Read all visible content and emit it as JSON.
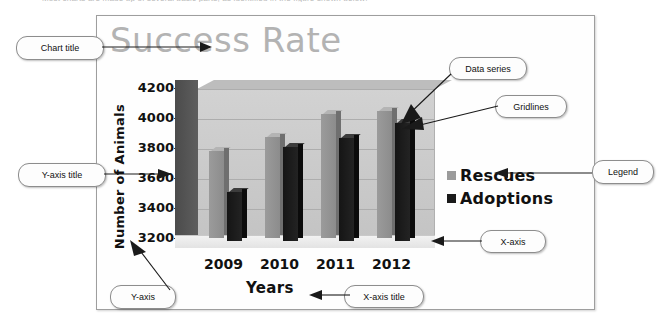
{
  "top_caption": "Most charts are made up of several basic parts, as identified in the figure shown below:",
  "slide": {
    "chart_title": "Success Rate"
  },
  "chart_data": {
    "type": "bar",
    "title": "Success Rate",
    "xlabel": "Years",
    "ylabel": "Number of Animals",
    "categories": [
      "2009",
      "2010",
      "2011",
      "2012"
    ],
    "ytick_labels": [
      "3200",
      "3400",
      "3600",
      "3800",
      "4000",
      "4200"
    ],
    "ylim": [
      3200,
      4200
    ],
    "ytick_step": 200,
    "grid": true,
    "legend_position": "right",
    "three_d": true,
    "series": [
      {
        "name": "Rescues",
        "color": "#9b9b9b",
        "values": [
          3780,
          3875,
          4025,
          4045
        ]
      },
      {
        "name": "Adoptions",
        "color": "#1a1a1a",
        "values": [
          3530,
          3825,
          3890,
          3985
        ]
      }
    ]
  },
  "callouts": {
    "chart_title": {
      "label": "Chart title"
    },
    "data_series": {
      "label": "Data series"
    },
    "gridlines": {
      "label": "Gridlines"
    },
    "y_axis_title": {
      "label": "Y-axis title"
    },
    "legend": {
      "label": "Legend"
    },
    "x_axis": {
      "label": "X-axis"
    },
    "y_axis": {
      "label": "Y-axis"
    },
    "x_axis_title": {
      "label": "X-axis title"
    }
  }
}
